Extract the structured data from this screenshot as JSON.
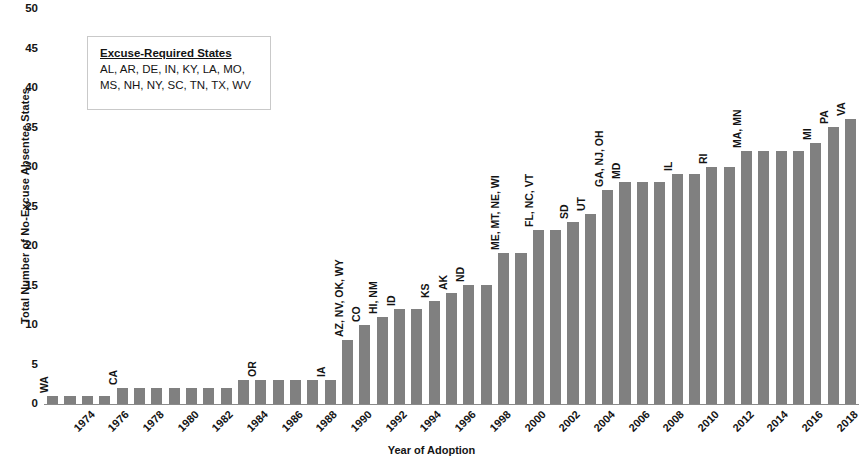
{
  "chart_data": {
    "type": "bar",
    "title": "",
    "xlabel": "Year of Adoption",
    "ylabel": "Total Number of No-Excuse Absentee States",
    "ylim": [
      0,
      50
    ],
    "ytick_step": 5,
    "yticks": [
      0,
      5,
      10,
      15,
      20,
      25,
      30,
      35,
      40,
      45,
      50
    ],
    "grid": false,
    "bar_color": "#808080",
    "xticks_shown": [
      "1974",
      "1976",
      "1978",
      "1980",
      "1982",
      "1984",
      "1986",
      "1988",
      "1990",
      "1992",
      "1994",
      "1996",
      "1998",
      "2000",
      "2002",
      "2004",
      "2006",
      "2008",
      "2010",
      "2012",
      "2014",
      "2016",
      "2018",
      "2020"
    ],
    "categories": [
      1974,
      1975,
      1976,
      1977,
      1978,
      1979,
      1980,
      1981,
      1982,
      1983,
      1984,
      1985,
      1986,
      1987,
      1988,
      1989,
      1990,
      1991,
      1992,
      1993,
      1994,
      1995,
      1996,
      1997,
      1998,
      1999,
      2000,
      2001,
      2002,
      2003,
      2004,
      2005,
      2006,
      2007,
      2008,
      2009,
      2010,
      2011,
      2012,
      2013,
      2014,
      2015,
      2016,
      2017,
      2018,
      2019,
      2020
    ],
    "values": [
      1,
      1,
      1,
      1,
      2,
      2,
      2,
      2,
      2,
      2,
      2,
      3,
      3,
      3,
      3,
      3,
      3,
      8,
      10,
      11,
      12,
      12,
      13,
      14,
      15,
      15,
      19,
      19,
      22,
      22,
      23,
      24,
      27,
      28,
      28,
      28,
      29,
      29,
      30,
      30,
      32,
      32,
      32,
      32,
      33,
      35,
      36
    ],
    "point_labels": [
      {
        "year": 1974,
        "label": "WA"
      },
      {
        "year": 1978,
        "label": "CA"
      },
      {
        "year": 1986,
        "label": "OR"
      },
      {
        "year": 1990,
        "label": "IA"
      },
      {
        "year": 1991,
        "label": "AZ, NV, OK, WY"
      },
      {
        "year": 1992,
        "label": "CO"
      },
      {
        "year": 1993,
        "label": "HI, NM"
      },
      {
        "year": 1994,
        "label": "ID"
      },
      {
        "year": 1996,
        "label": "KS"
      },
      {
        "year": 1997,
        "label": "AK"
      },
      {
        "year": 1998,
        "label": "ND"
      },
      {
        "year": 2000,
        "label": "ME, MT, NE, WI"
      },
      {
        "year": 2002,
        "label": "FL, NC, VT"
      },
      {
        "year": 2004,
        "label": "SD"
      },
      {
        "year": 2005,
        "label": "UT"
      },
      {
        "year": 2006,
        "label": "GA, NJ, OH"
      },
      {
        "year": 2007,
        "label": "MD"
      },
      {
        "year": 2010,
        "label": "IL"
      },
      {
        "year": 2012,
        "label": "RI"
      },
      {
        "year": 2014,
        "label": "MA, MN"
      },
      {
        "year": 2018,
        "label": "MI"
      },
      {
        "year": 2019,
        "label": "PA"
      },
      {
        "year": 2020,
        "label": "VA"
      }
    ],
    "annotation_box": {
      "title": "Excuse-Required States",
      "lines": [
        "AL, AR, DE, IN, KY, LA, MO,",
        "MS, NH, NY, SC, TN, TX, WV"
      ]
    }
  }
}
